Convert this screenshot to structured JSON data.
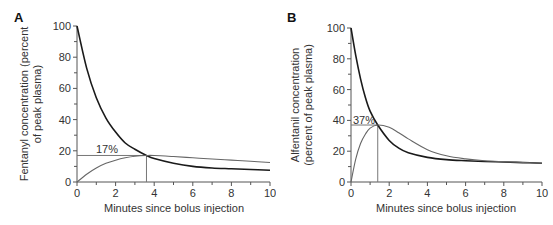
{
  "panels": [
    {
      "label": "A",
      "ylabel_line1": "Fentanyl concentration (percent",
      "ylabel_line2": "of peak plasma)",
      "xlabel": "Minutes since bolus injection",
      "annotation": "17%"
    },
    {
      "label": "B",
      "ylabel_line1": "Alfentanil concentration",
      "ylabel_line2": "(percent of peak plasma)",
      "xlabel": "Minutes since bolus injection",
      "annotation": "37%"
    }
  ],
  "chart_data": [
    {
      "type": "line",
      "title": "A",
      "xlabel": "Minutes since bolus injection",
      "ylabel": "Fentanyl concentration (percent of peak plasma)",
      "xlim": [
        0,
        10
      ],
      "ylim": [
        0,
        100
      ],
      "xticks": [
        0,
        2,
        4,
        6,
        8,
        10
      ],
      "yticks": [
        0,
        20,
        40,
        60,
        80,
        100
      ],
      "grid": false,
      "annotations": [
        {
          "text": "17%",
          "x": 3.6,
          "y": 17
        }
      ],
      "series": [
        {
          "name": "Plasma concentration",
          "x": [
            0,
            0.5,
            1,
            1.5,
            2,
            2.5,
            3,
            3.6,
            4,
            5,
            6,
            7,
            8,
            9,
            10
          ],
          "values": [
            100,
            73,
            54,
            41,
            32,
            25,
            21,
            17,
            15,
            12,
            10,
            9,
            8.5,
            8,
            7.5
          ]
        },
        {
          "name": "Effect-site concentration",
          "x": [
            0,
            0.5,
            1,
            1.5,
            2,
            2.5,
            3,
            3.6,
            4,
            5,
            6,
            7,
            8,
            9,
            10
          ],
          "values": [
            0,
            5,
            9,
            12,
            14,
            15.5,
            16.5,
            17,
            17,
            16.3,
            15.5,
            14.7,
            14,
            13.3,
            12.5
          ]
        }
      ]
    },
    {
      "type": "line",
      "title": "B",
      "xlabel": "Minutes since bolus injection",
      "ylabel": "Alfentanil concentration (percent of peak plasma)",
      "xlim": [
        0,
        10
      ],
      "ylim": [
        0,
        100
      ],
      "xticks": [
        0,
        2,
        4,
        6,
        8,
        10
      ],
      "yticks": [
        0,
        20,
        40,
        60,
        80,
        100
      ],
      "grid": false,
      "annotations": [
        {
          "text": "37%",
          "x": 1.4,
          "y": 37
        }
      ],
      "series": [
        {
          "name": "Plasma concentration",
          "x": [
            0,
            0.25,
            0.5,
            0.75,
            1,
            1.4,
            2,
            2.5,
            3,
            4,
            5,
            6,
            7,
            8,
            9,
            10
          ],
          "values": [
            100,
            82,
            67,
            55,
            46,
            37,
            27,
            22,
            19,
            16,
            14.5,
            13.8,
            13.3,
            13,
            12.6,
            12.2
          ]
        },
        {
          "name": "Effect-site concentration",
          "x": [
            0,
            0.25,
            0.5,
            0.75,
            1,
            1.4,
            2,
            2.5,
            3,
            4,
            5,
            6,
            7,
            8,
            9,
            10
          ],
          "values": [
            0,
            15,
            25,
            31,
            35,
            37,
            35.5,
            32,
            28,
            21,
            17,
            15,
            13.8,
            13.2,
            12.7,
            12.2
          ]
        }
      ]
    }
  ]
}
